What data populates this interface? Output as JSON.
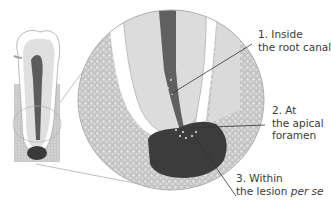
{
  "figure": {
    "colors": {
      "bone_fill": "#c8c8c8",
      "bone_texture": "#e4e4e4",
      "root_dentin": "#dcdcdc",
      "pdl_space": "#ffffff",
      "canal": "#606060",
      "lesion": "#3c3c3c",
      "outline": "#9a9a9a",
      "leader_line": "#333333",
      "text": "#3a3a3a"
    },
    "labels": [
      {
        "number": "1.",
        "line1": "1. Inside",
        "line2": "the root canal"
      },
      {
        "number": "2.",
        "line1": "2. At",
        "line2": "the apical",
        "line3": "foramen"
      },
      {
        "number": "3.",
        "line1": "3. Within",
        "line2_prefix": "the lesion ",
        "line2_italic": "per se"
      }
    ]
  }
}
